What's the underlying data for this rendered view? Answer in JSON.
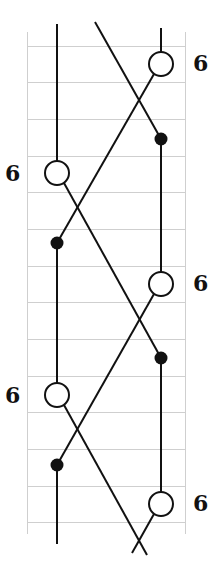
{
  "diagram": {
    "colors": {
      "grid": "#cfcfcf",
      "stroke": "#111111",
      "background": "#ffffff"
    },
    "grid": {
      "left": 27,
      "right": 185,
      "top": 46,
      "row_spacing": 36.7,
      "rows": 14
    },
    "labels": [
      {
        "text": "6",
        "x": 193,
        "y": 52,
        "side": "right"
      },
      {
        "text": "6",
        "x": 3,
        "y": 162,
        "side": "left"
      },
      {
        "text": "6",
        "x": 193,
        "y": 272,
        "side": "right"
      },
      {
        "text": "6",
        "x": 3,
        "y": 384,
        "side": "left"
      },
      {
        "text": "6",
        "x": 193,
        "y": 492,
        "side": "right"
      }
    ]
  }
}
